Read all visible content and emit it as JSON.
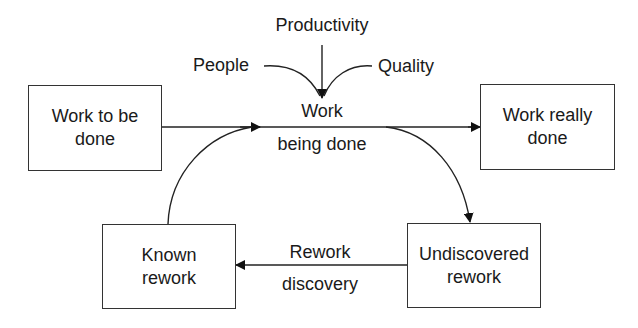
{
  "diagram": {
    "nodes": {
      "work_to_be_done": "Work to be done",
      "work_really_done": "Work really done",
      "known_rework": "Known rework",
      "undiscovered_rework": "Undiscovered rework"
    },
    "labels": {
      "productivity": "Productivity",
      "people": "People",
      "quality": "Quality",
      "work_top": "Work",
      "being_done": "being done",
      "rework_top": "Rework",
      "discovery": "discovery"
    },
    "edges": [
      {
        "from": "Work to be done",
        "to": "Work being done"
      },
      {
        "from": "Work being done",
        "to": "Work really done"
      },
      {
        "from": "Work being done",
        "to": "Undiscovered rework"
      },
      {
        "from": "Undiscovered rework",
        "to": "Known rework",
        "label": "Rework discovery"
      },
      {
        "from": "Known rework",
        "to": "Work being done"
      },
      {
        "from": "Productivity",
        "to": "Work being done"
      },
      {
        "from": "People",
        "to": "Work being done"
      },
      {
        "from": "Quality",
        "to": "Work being done"
      }
    ]
  }
}
